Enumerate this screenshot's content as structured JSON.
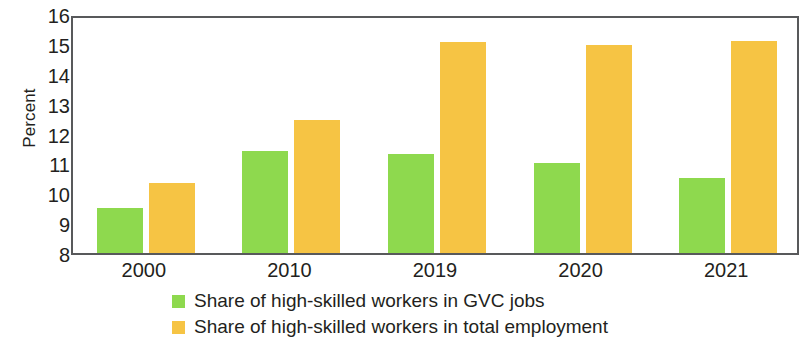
{
  "chart_data": {
    "type": "bar",
    "title": "",
    "subtitle": "",
    "xlabel": "",
    "ylabel": "Percent",
    "categories": [
      "2000",
      "2010",
      "2019",
      "2020",
      "2021"
    ],
    "series": [
      {
        "name": "Share of high-skilled workers in GVC jobs",
        "color": "#8ed94e",
        "values": [
          9.5,
          11.4,
          11.3,
          11.0,
          10.5
        ]
      },
      {
        "name": "Share of high-skilled workers in total employment",
        "color": "#f6c444",
        "values": [
          10.35,
          12.45,
          15.05,
          14.95,
          15.1
        ]
      }
    ],
    "ylim": [
      8,
      16
    ],
    "ytick_values": [
      8,
      9,
      10,
      11,
      12,
      13,
      14,
      15,
      16
    ],
    "ytick_labels": [
      "8",
      "9",
      "10",
      "11",
      "12",
      "13",
      "14",
      "15",
      "16"
    ],
    "grid": false,
    "legend_position": "bottom-center",
    "axis_color": "#58595b",
    "text_color": "#231f20",
    "background": "#ffffff"
  },
  "axis": {
    "y_title": "Percent"
  },
  "legend": {
    "items": [
      {
        "label": "Share of high-skilled workers in GVC jobs",
        "swatch": "green"
      },
      {
        "label": "Share of high-skilled workers in total employment",
        "swatch": "orange"
      }
    ]
  }
}
